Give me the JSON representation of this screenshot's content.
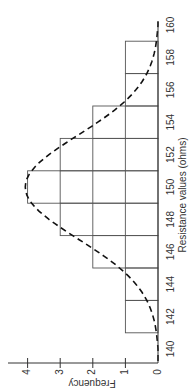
{
  "chart_data": {
    "type": "bar",
    "orientation_note": "figure rotated 90 degrees counter-clockwise",
    "title": "",
    "xlabel": "Resistance values (ohms)",
    "ylabel": "Frequency",
    "xlim": [
      140,
      160
    ],
    "ylim": [
      0,
      4
    ],
    "x_ticks": [
      140,
      142,
      144,
      146,
      148,
      150,
      152,
      154,
      156,
      158,
      160
    ],
    "y_ticks": [
      0,
      1,
      2,
      3,
      4
    ],
    "grid": true,
    "bins": [
      {
        "from": 141,
        "to": 143,
        "frequency": 1
      },
      {
        "from": 143,
        "to": 145,
        "frequency": 1
      },
      {
        "from": 145,
        "to": 147,
        "frequency": 2
      },
      {
        "from": 147,
        "to": 149,
        "frequency": 3
      },
      {
        "from": 149,
        "to": 151,
        "frequency": 4
      },
      {
        "from": 151,
        "to": 153,
        "frequency": 3
      },
      {
        "from": 153,
        "to": 155,
        "frequency": 2
      },
      {
        "from": 155,
        "to": 157,
        "frequency": 1
      },
      {
        "from": 157,
        "to": 159,
        "frequency": 1
      }
    ],
    "categories": [
      "141-143",
      "143-145",
      "145-147",
      "147-149",
      "149-151",
      "151-153",
      "153-155",
      "155-157",
      "157-159"
    ],
    "values": [
      1,
      1,
      2,
      3,
      4,
      3,
      2,
      1,
      1
    ],
    "overlay": {
      "type": "normal-curve",
      "style": "dashed",
      "mean": 150,
      "peak": 4.1,
      "range": [
        140,
        160
      ]
    }
  },
  "labels": {
    "xlabel": "Resistance values (ohms)",
    "ylabel": "Frequency"
  },
  "colors": {
    "bars": "#555555",
    "curve": "#111111",
    "axis": "#333333"
  }
}
